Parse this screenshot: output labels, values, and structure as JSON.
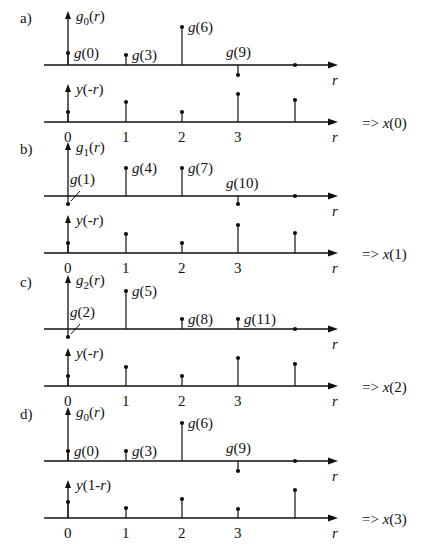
{
  "x_positions": [
    68,
    126,
    182,
    238,
    295
  ],
  "tick_labels": [
    "0",
    "1",
    "2",
    "3"
  ],
  "axis_label": "r",
  "arrow_symbol": "=>",
  "panels": [
    {
      "label": "a)",
      "top": {
        "name": "g_0(r)",
        "base": "g",
        "sub": "0",
        "arg": "(r)",
        "stems": [
          {
            "r": 0,
            "h": 12,
            "label": "g(0)"
          },
          {
            "r": 1,
            "h": 10,
            "label": "g(3)"
          },
          {
            "r": 2,
            "h": 38,
            "label": "g(6)"
          },
          {
            "r": 3,
            "h": -10,
            "label": "g(9)"
          },
          {
            "r": 4,
            "h": 0,
            "label": ""
          }
        ]
      },
      "bottom": {
        "name": "y(-r)",
        "stems": [
          {
            "r": 0,
            "h": 10
          },
          {
            "r": 1,
            "h": 20
          },
          {
            "r": 2,
            "h": 10
          },
          {
            "r": 3,
            "h": 28
          },
          {
            "r": 4,
            "h": 22
          }
        ]
      },
      "result": "x(0)"
    },
    {
      "label": "b)",
      "top": {
        "name": "g_1(r)",
        "base": "g",
        "sub": "1",
        "arg": "(r)",
        "stems": [
          {
            "r": 0,
            "h": -8,
            "label": "g(1)"
          },
          {
            "r": 1,
            "h": 28,
            "label": "g(4)"
          },
          {
            "r": 2,
            "h": 28,
            "label": "g(7)"
          },
          {
            "r": 3,
            "h": -8,
            "label": "g(10)"
          },
          {
            "r": 4,
            "h": 0,
            "label": ""
          }
        ]
      },
      "bottom": {
        "name": "y(-r)",
        "stems": [
          {
            "r": 0,
            "h": 10
          },
          {
            "r": 1,
            "h": 19
          },
          {
            "r": 2,
            "h": 10
          },
          {
            "r": 3,
            "h": 28
          },
          {
            "r": 4,
            "h": 20
          }
        ]
      },
      "result": "x(1)"
    },
    {
      "label": "c)",
      "top": {
        "name": "g_2(r)",
        "base": "g",
        "sub": "2",
        "arg": "(r)",
        "stems": [
          {
            "r": 0,
            "h": -8,
            "label": "g(2)"
          },
          {
            "r": 1,
            "h": 38,
            "label": "g(5)"
          },
          {
            "r": 2,
            "h": 10,
            "label": "g(8)"
          },
          {
            "r": 3,
            "h": 10,
            "label": "g(11)"
          },
          {
            "r": 4,
            "h": 0,
            "label": ""
          }
        ]
      },
      "bottom": {
        "name": "y(-r)",
        "stems": [
          {
            "r": 0,
            "h": 10
          },
          {
            "r": 1,
            "h": 19
          },
          {
            "r": 2,
            "h": 10
          },
          {
            "r": 3,
            "h": 28
          },
          {
            "r": 4,
            "h": 22
          }
        ]
      },
      "result": "x(2)"
    },
    {
      "label": "d)",
      "top": {
        "name": "g_0(r)",
        "base": "g",
        "sub": "0",
        "arg": "(r)",
        "stems": [
          {
            "r": 0,
            "h": 10,
            "label": "g(0)"
          },
          {
            "r": 1,
            "h": 10,
            "label": "g(3)"
          },
          {
            "r": 2,
            "h": 38,
            "label": "g(6)"
          },
          {
            "r": 3,
            "h": -10,
            "label": "g(9)"
          },
          {
            "r": 4,
            "h": 0,
            "label": ""
          }
        ]
      },
      "bottom": {
        "name": "y(1-r)",
        "stems": [
          {
            "r": 0,
            "h": 16
          },
          {
            "r": 1,
            "h": 10
          },
          {
            "r": 2,
            "h": 19
          },
          {
            "r": 3,
            "h": 9
          },
          {
            "r": 4,
            "h": 28
          }
        ]
      },
      "result": "x(3)"
    }
  ]
}
